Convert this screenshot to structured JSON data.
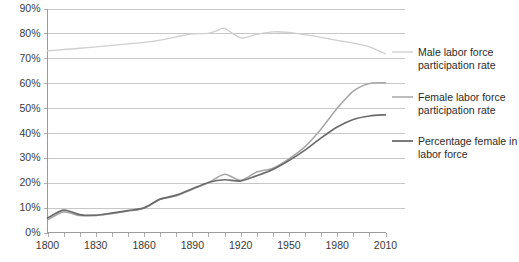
{
  "chart_data": {
    "type": "line",
    "title": "",
    "subtitle": "",
    "xlabel": "",
    "ylabel": "",
    "xlim": [
      1800,
      2010
    ],
    "ylim": [
      0,
      90
    ],
    "y_tick_labels": [
      "0%",
      "10%",
      "20%",
      "30%",
      "40%",
      "50%",
      "60%",
      "70%",
      "80%",
      "90%"
    ],
    "y_tick_values": [
      0,
      10,
      20,
      30,
      40,
      50,
      60,
      70,
      80,
      90
    ],
    "x_tick_labels": [
      "1800",
      "1830",
      "1860",
      "1890",
      "1920",
      "1950",
      "1980",
      "2010"
    ],
    "x_tick_values": [
      1800,
      1830,
      1860,
      1890,
      1920,
      1950,
      1980,
      2010
    ],
    "x_minor_ticks": [
      1810,
      1820,
      1840,
      1850,
      1870,
      1880,
      1900,
      1910,
      1930,
      1940,
      1960,
      1970,
      1990,
      2000
    ],
    "grid": "horizontal",
    "legend_position": "right",
    "series": [
      {
        "name": "Male labor force participation rate",
        "color": "#cfcfcf",
        "width": 1.4,
        "x": [
          1800,
          1810,
          1820,
          1830,
          1840,
          1850,
          1860,
          1870,
          1880,
          1890,
          1900,
          1905,
          1910,
          1920,
          1930,
          1940,
          1950,
          1960,
          1970,
          1980,
          1990,
          2000,
          2010
        ],
        "values": [
          73.0,
          73.5,
          74.0,
          74.6,
          75.2,
          75.8,
          76.4,
          77.3,
          78.6,
          79.8,
          80.0,
          81.0,
          82.0,
          78.2,
          79.6,
          80.6,
          80.4,
          79.5,
          78.4,
          77.2,
          76.1,
          74.6,
          71.8
        ]
      },
      {
        "name": "Female labor force participation rate",
        "color": "#a6a6a6",
        "width": 1.5,
        "x": [
          1800,
          1810,
          1820,
          1830,
          1840,
          1850,
          1860,
          1870,
          1880,
          1890,
          1900,
          1910,
          1920,
          1930,
          1940,
          1950,
          1960,
          1970,
          1980,
          1990,
          2000,
          2010
        ],
        "values": [
          5.0,
          8.2,
          6.8,
          6.9,
          7.6,
          8.6,
          9.7,
          13.3,
          14.7,
          17.4,
          20.0,
          23.4,
          21.0,
          24.3,
          25.8,
          29.6,
          34.5,
          41.6,
          49.9,
          56.8,
          59.9,
          60.2
        ]
      },
      {
        "name": "Percentage female in labor force",
        "color": "#6b6b6b",
        "width": 1.7,
        "x": [
          1800,
          1810,
          1820,
          1830,
          1840,
          1850,
          1860,
          1870,
          1880,
          1890,
          1900,
          1910,
          1920,
          1930,
          1940,
          1950,
          1960,
          1970,
          1980,
          1990,
          2000,
          2010
        ],
        "values": [
          5.8,
          9.0,
          7.2,
          6.9,
          7.8,
          8.8,
          9.9,
          13.4,
          15.0,
          17.6,
          20.1,
          21.2,
          20.7,
          22.8,
          25.3,
          28.9,
          33.1,
          38.0,
          42.4,
          45.4,
          46.8,
          47.3
        ]
      }
    ],
    "legend_entries": [
      {
        "label_line1": "Male labor force",
        "label_line2": "participation rate",
        "color": "#cfcfcf"
      },
      {
        "label_line1": "Female labor force",
        "label_line2": "participation rate",
        "color": "#a6a6a6"
      },
      {
        "label_line1": "Percentage female in",
        "label_line2": "labor force",
        "color": "#6b6b6b"
      }
    ]
  }
}
